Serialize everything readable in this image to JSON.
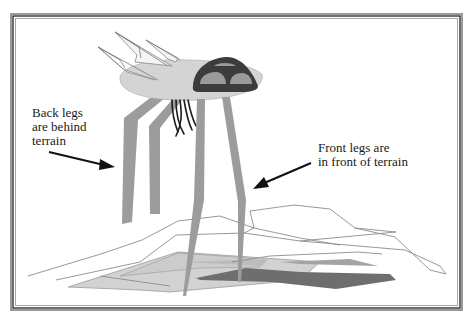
{
  "figure": {
    "labels": {
      "back_legs": "Back legs\nare behind\nterrain",
      "front_legs": "Front legs are\nin front of terrain"
    }
  },
  "colors": {
    "frame": "#555555",
    "background": "#ffffff",
    "body": "#d4d4d4",
    "head_dark": "#3c3c3c",
    "head_windows": "#9a9a9a",
    "legs": "#9c9c9c",
    "terrain_outline": "#8a8a8a",
    "terrain_light": "#cfcfcf",
    "terrain_mid": "#a6a6a6",
    "terrain_dark": "#6e6e6e",
    "tentacles": "#1e1e1e",
    "arrows": "#111111"
  }
}
